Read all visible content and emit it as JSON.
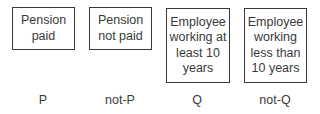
{
  "cards": [
    {
      "text": "Pension paid",
      "label": "P"
    },
    {
      "text": "Pension not paid",
      "label": "not-P"
    },
    {
      "text": "Employee working at least 10 years",
      "label": "Q"
    },
    {
      "text": "Employee working less than 10 years",
      "label": "not-Q"
    }
  ]
}
